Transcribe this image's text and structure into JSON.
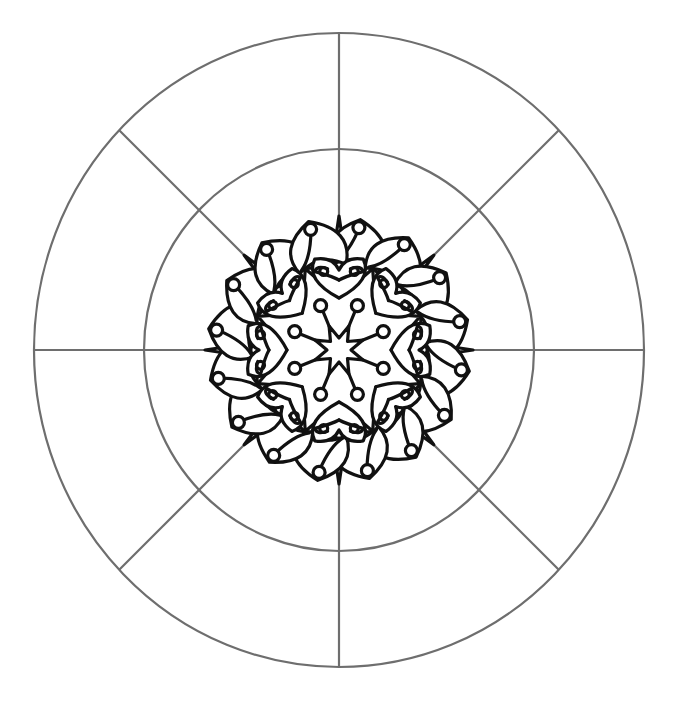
{
  "page": {
    "background": "#ffffff",
    "frame_color": "#6e6e6e",
    "ink_color": "#111111"
  },
  "layout": {
    "center": [
      339,
      350
    ],
    "outer_ellipse": {
      "rx": 305,
      "ry": 317
    },
    "inner_ellipse": {
      "rx": 195,
      "ry": 201
    },
    "divider_count": 8,
    "symmetry": 8
  },
  "mandala": {
    "central_star": {
      "points": 8,
      "outer_r": 26,
      "inner_r": 12
    },
    "dots": {
      "count": 8,
      "r": 48,
      "radius": 6
    },
    "big_star": {
      "tip_r": 88,
      "notch_r": 52
    },
    "hearts": {
      "count": 8,
      "tip_r": 52,
      "top_r": 90
    },
    "spikes": {
      "count": 8,
      "tip_r": 134
    },
    "buds": {
      "count": 16,
      "tip_r": 132,
      "dot_radius": 6
    }
  }
}
